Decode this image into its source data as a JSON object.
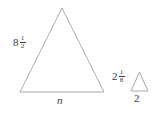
{
  "diagram": {
    "background_color": "#ffffff",
    "stroke_color": "#a8a8a8",
    "text_color": "#3a3a3a",
    "shapes": [
      {
        "name": "large-triangle",
        "type": "triangle",
        "apex": [
          62,
          8
        ],
        "base_left": [
          20,
          92
        ],
        "base_right": [
          104,
          92
        ]
      },
      {
        "name": "small-triangle",
        "type": "triangle",
        "apex": [
          139,
          72
        ],
        "base_left": [
          131,
          91
        ],
        "base_right": [
          148,
          91
        ]
      }
    ]
  },
  "labels": {
    "large_triangle_side": {
      "whole": "8",
      "numerator": "1",
      "denominator": "2",
      "full_text": "8 1/2"
    },
    "large_triangle_base": {
      "text": "n"
    },
    "small_triangle_side": {
      "whole": "2",
      "numerator": "1",
      "denominator": "8",
      "full_text": "2 1/8"
    },
    "small_triangle_base": {
      "text": "2"
    }
  }
}
